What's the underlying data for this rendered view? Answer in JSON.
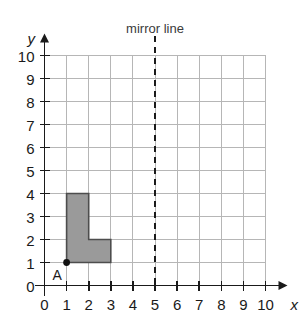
{
  "chart_data": {
    "type": "scatter",
    "title": "",
    "xlabel": "x",
    "ylabel": "y",
    "xlim": [
      0,
      10
    ],
    "ylim": [
      0,
      10
    ],
    "xticks": [
      "0",
      "1",
      "2",
      "3",
      "4",
      "5",
      "6",
      "7",
      "8",
      "9",
      "10"
    ],
    "yticks": [
      "0",
      "1",
      "2",
      "3",
      "4",
      "5",
      "6",
      "7",
      "8",
      "9",
      "10"
    ],
    "grid": true,
    "grid_spacing": 1,
    "legend": "none",
    "annotations": [
      {
        "name": "mirror-line",
        "label": "mirror line",
        "kind": "vertical-dashed-line",
        "x": 5
      },
      {
        "name": "point-a",
        "label": "A",
        "kind": "marked-point",
        "x": 1,
        "y": 1
      }
    ],
    "shapes": [
      {
        "name": "shaded-l-shape",
        "kind": "polygon",
        "fill": "#9a9a9a",
        "stroke": "#4d4d4d",
        "vertices": [
          [
            1,
            1
          ],
          [
            1,
            4
          ],
          [
            2,
            4
          ],
          [
            2,
            2
          ],
          [
            3,
            2
          ],
          [
            3,
            1
          ]
        ]
      }
    ]
  },
  "labels": {
    "mirror_line": "mirror line",
    "point_a": "A",
    "x_axis": "x",
    "y_axis": "y",
    "x_ticks": [
      "0",
      "1",
      "2",
      "3",
      "4",
      "5",
      "6",
      "7",
      "8",
      "9",
      "10"
    ],
    "y_ticks": [
      "0",
      "1",
      "2",
      "3",
      "4",
      "5",
      "6",
      "7",
      "8",
      "9",
      "10"
    ]
  },
  "colors": {
    "grid": "#b6b6b6",
    "axis": "#1a1a1a",
    "shape_fill": "#9a9a9a",
    "shape_stroke": "#4d4d4d",
    "mirror_line": "#1a1a1a",
    "background": "#ffffff"
  }
}
